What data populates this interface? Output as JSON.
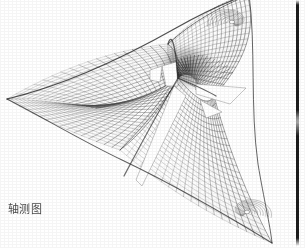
{
  "figure": {
    "caption": "轴测图",
    "caption_translation_note": "axonometric drawing",
    "title": "轴测图",
    "drawing_type": "axonometric-line-drawing",
    "background_color": "#ffffff",
    "line_color": "#3a3a3a",
    "accent_color": "#1d1d1d",
    "mesh": {
      "description": "dense quadrilateral grid of warp and weft curves over a doubly-curved anticlastic surface",
      "u_lines": 54,
      "v_lines": 52,
      "stroke_width": 0.45
    },
    "apexes": [
      {
        "name": "left-apex",
        "x": 7,
        "y": 99
      },
      {
        "name": "top-apex",
        "x": 247,
        "y": -6
      },
      {
        "name": "bottom-right-apex",
        "x": 272,
        "y": 243
      }
    ],
    "high_points": [
      {
        "name": "top-mast",
        "x": 247,
        "y": 2
      },
      {
        "name": "center-mast",
        "x": 178,
        "y": 78
      },
      {
        "name": "left-ridge",
        "x": 168,
        "y": 45
      }
    ],
    "voids": [
      {
        "name": "center-wedge-upper",
        "x": 170,
        "y": 70
      },
      {
        "name": "center-wedge-lower",
        "x": 150,
        "y": 140
      },
      {
        "name": "right-wedge",
        "x": 215,
        "y": 92
      }
    ],
    "spiral_nodes": [
      {
        "name": "top-right-spiral",
        "x": 232,
        "y": 22
      },
      {
        "name": "bottom-right-spiral",
        "x": 247,
        "y": 212
      }
    ]
  },
  "rule": {
    "name": "page-gutter-rule",
    "color": "#1d1d1d",
    "x": 296,
    "width": 3
  }
}
